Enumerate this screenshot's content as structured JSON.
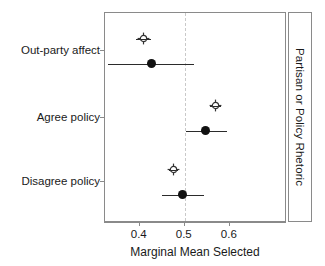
{
  "chart_data": {
    "type": "scatter",
    "title": "",
    "xlabel": "Marginal Mean Selected",
    "ylabel": "",
    "strip_label": "Partisan or Policy Rhetoric",
    "xlim": [
      0.3227,
      0.7271
    ],
    "xticks": [
      0.4,
      0.5,
      0.6
    ],
    "xticklabels": [
      "0.4",
      "0.5",
      "0.6"
    ],
    "categories": [
      "Out-party affect",
      "Agree policy",
      "Disagree policy"
    ],
    "grid": false,
    "legend": "none",
    "reference_line": {
      "value": 0.5,
      "style": "dashed",
      "color": "#c9c9c9"
    },
    "series": [
      {
        "name": "open",
        "marker": "open-crossed-circle",
        "color": "#333333",
        "points": [
          {
            "category": "Out-party affect",
            "value": 0.408,
            "ci_low": 0.391,
            "ci_high": 0.426
          },
          {
            "category": "Agree policy",
            "value": 0.568,
            "ci_low": 0.557,
            "ci_high": 0.58
          },
          {
            "category": "Disagree policy",
            "value": 0.475,
            "ci_low": 0.464,
            "ci_high": 0.486
          }
        ]
      },
      {
        "name": "filled",
        "marker": "filled-circle",
        "color": "#111111",
        "points": [
          {
            "category": "Out-party affect",
            "value": 0.427,
            "ci_low": 0.33,
            "ci_high": 0.52
          },
          {
            "category": "Agree policy",
            "value": 0.547,
            "ci_low": 0.502,
            "ci_high": 0.593
          },
          {
            "category": "Disagree policy",
            "value": 0.496,
            "ci_low": 0.45,
            "ci_high": 0.542
          }
        ]
      }
    ]
  },
  "axis": {
    "x_label": "Marginal Mean Selected",
    "tick_0": "0.4",
    "tick_1": "0.5",
    "tick_2": "0.6",
    "cat_0": "Out-party affect",
    "cat_1": "Agree policy",
    "cat_2": "Disagree policy"
  },
  "strip": {
    "label": "Partisan or Policy Rhetoric"
  }
}
